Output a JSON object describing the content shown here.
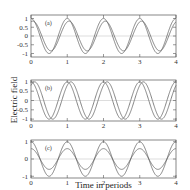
{
  "chart_data": {
    "type": "line",
    "ylabel": "Electric field",
    "xlabel": "Time in periods",
    "xlim": [
      0,
      4
    ],
    "x_ticks": [
      "0",
      "1",
      "2",
      "3",
      "4"
    ],
    "panels": [
      {
        "label": "(a)",
        "ylim": [
          -1.2,
          1.2
        ],
        "y_ticks": [
          "1",
          "0.5",
          "0",
          "-0.5",
          "-1"
        ],
        "series": [
          {
            "name": "curve 1",
            "amplitude": 1.0,
            "phase_periods": 0.0,
            "function": "cos"
          },
          {
            "name": "curve 2",
            "amplitude": 0.85,
            "phase_periods": 0.05,
            "function": "cos"
          }
        ]
      },
      {
        "label": "(b)",
        "ylim": [
          -1.1,
          1.1
        ],
        "y_ticks": [
          "1",
          "0.5",
          "0",
          "-0.5",
          "-1"
        ],
        "series": [
          {
            "name": "curve 1",
            "amplitude": 1.0,
            "phase_periods": 0.0,
            "function": "cos"
          },
          {
            "name": "curve 2",
            "amplitude": 1.0,
            "phase_periods": 0.1,
            "function": "cos"
          }
        ]
      },
      {
        "label": "(c)",
        "ylim": [
          -1.1,
          1.1
        ],
        "y_ticks": [
          "1",
          "0",
          "-1"
        ],
        "series": [
          {
            "name": "curve 1",
            "amplitude": 1.0,
            "phase_periods": 0.0,
            "function": "cos"
          },
          {
            "name": "curve 2",
            "amplitude": 0.6,
            "phase_periods": 0.0,
            "function": "cos"
          }
        ]
      }
    ],
    "grid": false,
    "zero_line": true
  }
}
